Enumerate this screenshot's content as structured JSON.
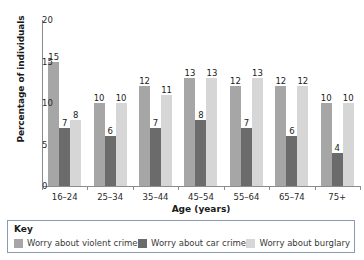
{
  "chart_data": {
    "type": "bar",
    "title": "",
    "xlabel": "Age (years)",
    "ylabel": "Percentage of individuals",
    "categories": [
      "16–24",
      "25–34",
      "35–44",
      "45–54",
      "55–64",
      "65–74",
      "75+"
    ],
    "series": [
      {
        "name": "Worry about violent crime",
        "color": "#a6a6a6",
        "values": [
          15,
          10,
          12,
          13,
          12,
          12,
          10
        ]
      },
      {
        "name": "Worry about car crime",
        "color": "#6b6b6b",
        "values": [
          7,
          6,
          7,
          8,
          7,
          6,
          4
        ]
      },
      {
        "name": "Worry about burglary",
        "color": "#d6d6d6",
        "values": [
          8,
          10,
          11,
          13,
          13,
          12,
          10
        ]
      }
    ],
    "ylim": [
      0,
      20
    ],
    "yticks": [
      0,
      5,
      10,
      15,
      20
    ],
    "ytick_labels": [
      "0",
      "5",
      "10",
      "15",
      "20"
    ],
    "grid": false,
    "legend_position": "bottom",
    "legend_title": "Key",
    "data_labels": true
  },
  "axis": {
    "y_label": "Percentage of individuals",
    "x_label": "Age (years)"
  },
  "legend": {
    "title": "Key",
    "items": [
      {
        "label": "Worry about violent crime",
        "color": "#a6a6a6"
      },
      {
        "label": "Worry about car crime",
        "color": "#6b6b6b"
      },
      {
        "label": "Worry about burglary",
        "color": "#d6d6d6"
      }
    ]
  },
  "colors": {
    "axis": "#8c8c8c",
    "legend_border": "#8a9bb5",
    "text": "#1a1a1a",
    "background": "#ffffff"
  }
}
